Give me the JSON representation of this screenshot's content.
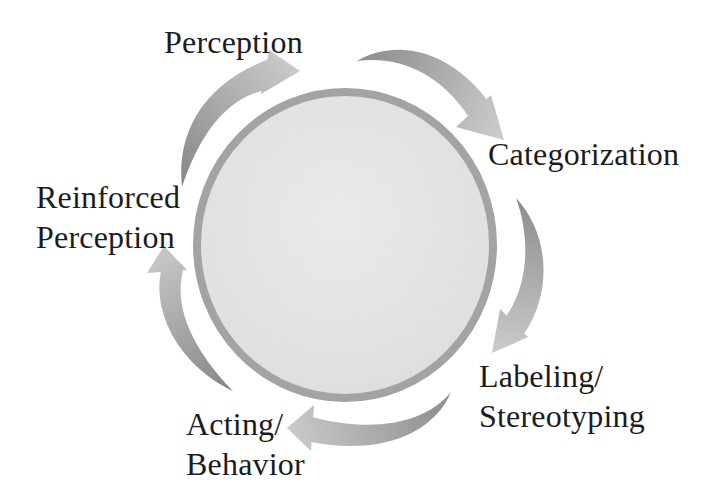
{
  "diagram": {
    "type": "cycle",
    "stages": [
      {
        "name": "Perception",
        "lines": [
          "Perception"
        ]
      },
      {
        "name": "Categorization",
        "lines": [
          "Categorization"
        ]
      },
      {
        "name": "Labeling/Stereotyping",
        "lines": [
          "Labeling/",
          "Stereotyping"
        ]
      },
      {
        "name": "Acting/Behavior",
        "lines": [
          "Acting/",
          "Behavior"
        ]
      },
      {
        "name": "Reinforced Perception",
        "lines": [
          "Reinforced",
          "Perception"
        ]
      }
    ],
    "arrows": [
      {
        "from": "Perception",
        "to": "Categorization"
      },
      {
        "from": "Categorization",
        "to": "Labeling/Stereotyping"
      },
      {
        "from": "Labeling/Stereotyping",
        "to": "Acting/Behavior"
      },
      {
        "from": "Acting/Behavior",
        "to": "Reinforced Perception"
      },
      {
        "from": "Reinforced Perception",
        "to": "Perception"
      }
    ],
    "colors": {
      "background": "#ffffff",
      "circle_fill": "#e2e2e2",
      "circle_border": "#a3a3a3",
      "arrow_tail": "#868686",
      "arrow_head": "#cbcbcb",
      "text": "#1c1c1c"
    }
  }
}
